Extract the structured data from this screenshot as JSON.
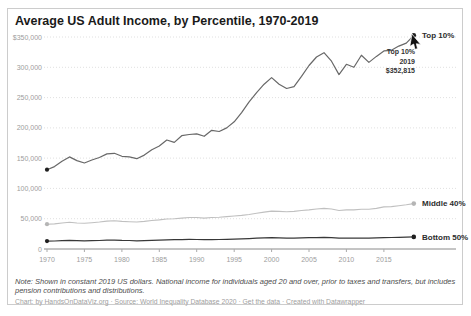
{
  "title": "Average US Adult Income, by Percentile, 1970-2019",
  "note": "Note: Shown in constant 2019 US dollars. National income for individuals aged 20 and over, prior to taxes and transfers, but includes pension contributions and distributions.",
  "footer": {
    "part1": "Chart: by HandsOnDataViz.org · Source: World Inequality Database 2020 · ",
    "link": "Get the data",
    "part2": " · Created with Datawrapper"
  },
  "tooltip": {
    "series": "Top 10%",
    "year": "2019",
    "value": "$352,815"
  },
  "colors": {
    "top10_line": "#686868",
    "middle40_line": "#c0c0c0",
    "bottom50_line": "#383838",
    "grid": "#e0e0e0",
    "axis": "#8a8a8a",
    "tick_text": "#9d9d9d"
  },
  "chart_data": {
    "type": "line",
    "title": "Average US Adult Income, by Percentile, 1970-2019",
    "xlabel": "",
    "ylabel": "Income (constant 2019 US dollars)",
    "x": {
      "start": 1970,
      "end": 2019,
      "step": 1
    },
    "x_ticks": [
      1970,
      1975,
      1980,
      1985,
      1990,
      1995,
      2000,
      2005,
      2010,
      2015
    ],
    "ylim": [
      0,
      350000
    ],
    "y_ticks": [
      {
        "value": 0,
        "label": "0"
      },
      {
        "value": 50000,
        "label": "50,000"
      },
      {
        "value": 100000,
        "label": "100,000"
      },
      {
        "value": 150000,
        "label": "150,000"
      },
      {
        "value": 200000,
        "label": "200,000"
      },
      {
        "value": 250000,
        "label": "250,000"
      },
      {
        "value": 300000,
        "label": "300,000"
      },
      {
        "value": 350000,
        "label": "$350,000"
      }
    ],
    "grid": "horizontal-dotted",
    "legend_position": "right-end-labels",
    "series": [
      {
        "name": "Middle 40%",
        "color": "#c0c0c0",
        "dot_color": "#b5b5b5",
        "width": 1.1,
        "values": [
          41000,
          41500,
          43000,
          44000,
          43000,
          42500,
          43500,
          44500,
          46000,
          46500,
          45500,
          45000,
          44500,
          45500,
          47000,
          48000,
          49500,
          50000,
          51000,
          52000,
          52000,
          51000,
          52000,
          52500,
          53500,
          54500,
          55500,
          57000,
          59000,
          61000,
          62500,
          62000,
          61500,
          62000,
          63500,
          64500,
          66000,
          67000,
          66000,
          63500,
          64500,
          64500,
          65500,
          65500,
          67000,
          69500,
          70000,
          71500,
          73000,
          75000
        ]
      },
      {
        "name": "Bottom 50%",
        "color": "#383838",
        "dot_color": "#1f1f1f",
        "width": 1.2,
        "values": [
          13000,
          13200,
          13800,
          14200,
          13800,
          13400,
          13800,
          14100,
          14600,
          14700,
          14200,
          14000,
          13600,
          13800,
          14400,
          14700,
          15100,
          15300,
          15600,
          15800,
          15700,
          15300,
          15600,
          15700,
          16000,
          16300,
          16700,
          17200,
          17800,
          18300,
          18600,
          18300,
          18000,
          18000,
          18300,
          18600,
          18900,
          19100,
          18600,
          17800,
          17900,
          17800,
          18000,
          18000,
          18300,
          18900,
          19000,
          19300,
          19600,
          19900
        ]
      },
      {
        "name": "Top 10%",
        "color": "#686868",
        "dot_color": "#1f1f1f",
        "width": 1.2,
        "values": [
          131000,
          136000,
          145000,
          152000,
          146000,
          142000,
          147000,
          151000,
          157000,
          158000,
          153000,
          152000,
          149000,
          155000,
          164000,
          170000,
          180000,
          176000,
          187000,
          189000,
          190000,
          186000,
          196000,
          194000,
          200000,
          210000,
          225000,
          243000,
          258000,
          272000,
          283000,
          272000,
          265000,
          268000,
          285000,
          303000,
          317000,
          324000,
          310000,
          288000,
          305000,
          300000,
          320000,
          308000,
          318000,
          327000,
          328000,
          335000,
          340000,
          352815
        ]
      }
    ],
    "annotations": [
      {
        "type": "hover-tooltip",
        "series": "Top 10%",
        "x": 2019,
        "y": 352815,
        "lines": [
          "Top 10%",
          "2019",
          "$352,815"
        ]
      }
    ]
  }
}
